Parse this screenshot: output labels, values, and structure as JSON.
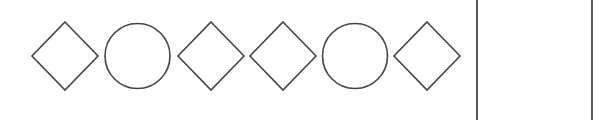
{
  "puzzle": {
    "sequence": [
      {
        "shape": "diamond",
        "cx": 65,
        "cy": 56
      },
      {
        "shape": "circle",
        "cx": 137.5,
        "cy": 56
      },
      {
        "shape": "diamond",
        "cx": 211,
        "cy": 56
      },
      {
        "shape": "diamond",
        "cx": 283,
        "cy": 56
      },
      {
        "shape": "circle",
        "cx": 355,
        "cy": 56
      },
      {
        "shape": "diamond",
        "cx": 427,
        "cy": 56
      }
    ],
    "shape_size": 66,
    "stroke_color": "#444444",
    "answer_box": {
      "left_x": 477,
      "right_x": 592
    }
  }
}
